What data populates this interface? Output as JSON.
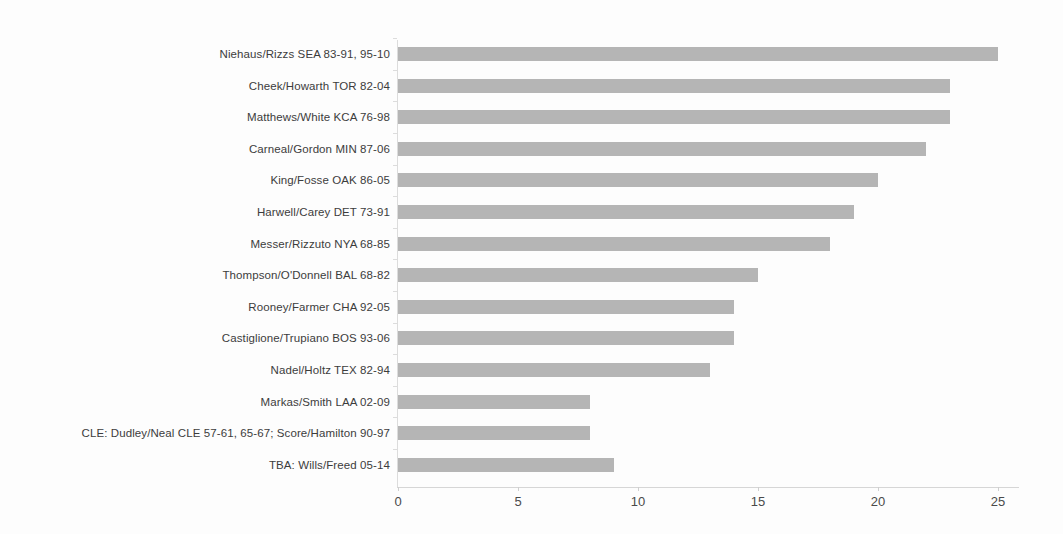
{
  "chart_data": {
    "type": "bar",
    "orientation": "horizontal",
    "title": "",
    "subtitle": "",
    "xlabel": "",
    "ylabel": "",
    "xlim": [
      0,
      26
    ],
    "ylim": null,
    "grid": false,
    "legend": null,
    "xticks": [
      0,
      5,
      10,
      15,
      20,
      25
    ],
    "xtick_labels": [
      "0",
      "5",
      "10",
      "15",
      "20",
      "25"
    ],
    "bar_color": "#b5b5b5",
    "axis_color": "#d6d6d6",
    "label_color": "#3c3c3c",
    "background_color": "#fdfdfd",
    "categories": [
      "Niehaus/Rizzs SEA 83-91, 95-10",
      "Cheek/Howarth TOR 82-04",
      "Matthews/White KCA 76-98",
      "Carneal/Gordon MIN 87-06",
      "King/Fosse OAK 86-05",
      "Harwell/Carey DET 73-91",
      "Messer/Rizzuto NYA 68-85",
      "Thompson/O'Donnell BAL 68-82",
      "Rooney/Farmer CHA 92-05",
      "Castiglione/Trupiano BOS 93-06",
      "Nadel/Holtz TEX 82-94",
      "Markas/Smith LAA 02-09",
      "CLE: Dudley/Neal CLE 57-61, 65-67; Score/Hamilton 90-97",
      "TBA: Wills/Freed 05-14"
    ],
    "values": [
      25,
      23,
      23,
      22,
      20,
      19,
      18,
      15,
      14,
      14,
      13,
      8,
      8,
      9
    ]
  }
}
